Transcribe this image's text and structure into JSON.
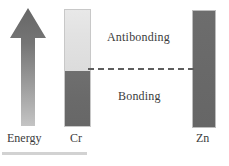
{
  "figure": {
    "type": "molecular-orbital-energy-diagram",
    "background_color": "#ffffff"
  },
  "axis": {
    "energy_arrow": {
      "icon": "up-arrow-icon",
      "caption": "Energy",
      "direction": "up",
      "gradient_top_color": "#6b6b6b",
      "gradient_bottom_color": "#bdbdbd"
    }
  },
  "bars": [
    {
      "name": "cr-bar",
      "caption": "Cr",
      "segments": [
        {
          "name": "antibonding-segment",
          "fill": "light",
          "color": "#e2e2e2",
          "fraction": 0.525
        },
        {
          "name": "bonding-segment",
          "fill": "dark",
          "color": "#6a6a6a",
          "fraction": 0.475
        }
      ]
    },
    {
      "name": "zn-bar",
      "caption": "Zn",
      "segments": [
        {
          "name": "filled-band",
          "fill": "dark",
          "color": "#696969",
          "fraction": 1.0
        }
      ]
    }
  ],
  "level_line": {
    "name": "fermi-level-line",
    "style": "dashed",
    "color": "#5d5d5d"
  },
  "regions": {
    "antibonding_label": "Antibonding",
    "bonding_label": "Bonding"
  },
  "captions": {
    "energy": "Energy",
    "cr": "Cr",
    "zn": "Zn"
  },
  "rule": {
    "name": "bottom-rule",
    "color": "#d2d2d2"
  }
}
